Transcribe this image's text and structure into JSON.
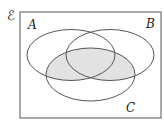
{
  "diagram": {
    "type": "venn",
    "universal_label": "ℰ",
    "sets": [
      {
        "name": "A",
        "label": "A"
      },
      {
        "name": "B",
        "label": "B"
      },
      {
        "name": "C",
        "label": "C"
      }
    ],
    "shaded_region": "C ∩ (A ∪ B)",
    "colors": {
      "stroke": "#555555",
      "shade": "#e2e2e2",
      "background": "#ffffff"
    }
  }
}
